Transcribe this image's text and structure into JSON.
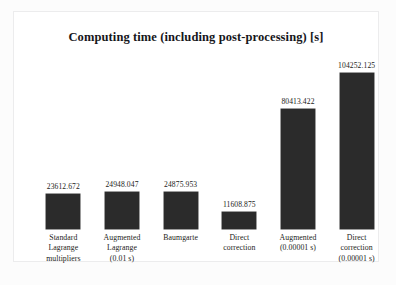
{
  "chart_data": {
    "type": "bar",
    "title": "Computing time (including post-processing) [s]",
    "xlabel": "",
    "ylabel": "",
    "grid": false,
    "legend": false,
    "ylim": [
      0,
      115000
    ],
    "bar_color": "#2b2b2b",
    "categories": [
      "Standard Lagrange multipliers",
      "Augmented Lagrange (0.01 s)",
      "Baumgarte",
      "Direct correction",
      "Augmented (0.00001 s)",
      "Direct correction (0.00001 s)"
    ],
    "category_lines": [
      [
        "Standard",
        "Lagrange",
        "multipliers"
      ],
      [
        "Augmented",
        "Lagrange",
        "(0.01 s)"
      ],
      [
        "Baumgarte"
      ],
      [
        "Direct",
        "correction"
      ],
      [
        "Augmented",
        "(0.00001 s)"
      ],
      [
        "Direct",
        "correction",
        "(0.00001 s)"
      ]
    ],
    "values": [
      23612.672,
      24948.047,
      24875.953,
      11608.875,
      80413.422,
      104252.125
    ],
    "value_labels": [
      "23612.672",
      "24948.047",
      "24875.953",
      "11608.875",
      "80413.422",
      "104252.125"
    ]
  }
}
